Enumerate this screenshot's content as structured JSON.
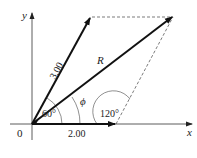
{
  "diagram": {
    "axes": {
      "x_label": "x",
      "y_label": "y",
      "origin_label": "0"
    },
    "vectors": [
      {
        "name": "A",
        "label": "3.00",
        "angle_deg": 60
      },
      {
        "name": "B",
        "label": "2.00",
        "angle_deg": 0
      },
      {
        "name": "R",
        "label": "R"
      }
    ],
    "angles": [
      {
        "label": "60°"
      },
      {
        "label": "ϕ"
      },
      {
        "label": "120°"
      }
    ]
  }
}
